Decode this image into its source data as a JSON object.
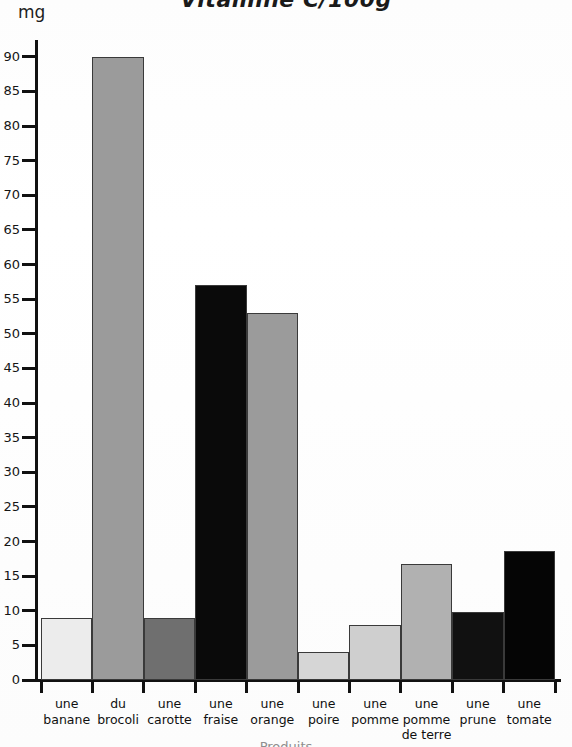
{
  "chart_data": {
    "type": "bar",
    "title": "Vitamine C/100g",
    "xlabel": "Produits",
    "ylabel": "mg",
    "ylim": [
      0,
      92
    ],
    "grid": false,
    "legend": null,
    "yticks": [
      0,
      5,
      10,
      15,
      20,
      25,
      30,
      35,
      40,
      45,
      50,
      55,
      60,
      65,
      70,
      75,
      80,
      85,
      90
    ],
    "categories": [
      "une banane",
      "du brocoli",
      "une carotte",
      "une fraise",
      "une orange",
      "une poire",
      "une pomme",
      "une pomme de terre",
      "une prune",
      "une tomate"
    ],
    "category_lines": [
      [
        "une",
        "banane"
      ],
      [
        "du",
        "brocoli"
      ],
      [
        "une",
        "carotte"
      ],
      [
        "une",
        "fraise"
      ],
      [
        "une",
        "orange"
      ],
      [
        "une",
        "poire"
      ],
      [
        "une",
        "pomme"
      ],
      [
        "une",
        "pomme",
        "de terre"
      ],
      [
        "une",
        "prune"
      ],
      [
        "une",
        "tomate"
      ]
    ],
    "values": [
      9,
      90,
      9,
      57,
      53,
      4,
      8,
      16.7,
      9.8,
      18.7
    ],
    "colors": [
      "#ececec",
      "#9b9b9b",
      "#6f6f6f",
      "#0a0a0a",
      "#9b9b9b",
      "#d6d6d6",
      "#cfcfcf",
      "#b1b1b1",
      "#111111",
      "#050505"
    ]
  }
}
